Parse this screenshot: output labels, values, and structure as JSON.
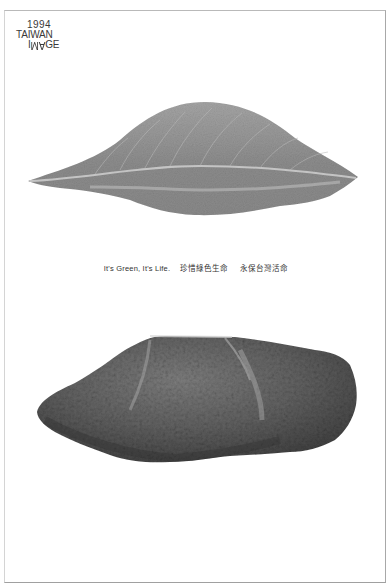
{
  "poster": {
    "logo": {
      "year": "1994",
      "country": "TAIWAN",
      "image_word_parts": [
        "I",
        "M",
        "A",
        "GE"
      ]
    },
    "tagline": {
      "english": "It's Green, It's Life.",
      "chinese_1": "珍惜綠色生命",
      "chinese_2": "永保台灣活命"
    },
    "images": [
      {
        "subject": "leaf",
        "description": "Grayscale photograph of a green leaf lying horizontally"
      },
      {
        "subject": "rock",
        "description": "Grayscale photograph of a rough rock"
      }
    ],
    "colors": {
      "background": "#ffffff",
      "text": "#333333",
      "leaf": "#8e8e8e",
      "rock": "#5a5a5a"
    }
  }
}
